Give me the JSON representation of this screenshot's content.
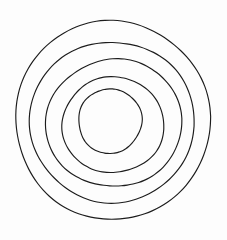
{
  "figure": {
    "kind": "line-drawing",
    "style": "hand-drawn",
    "canvas": {
      "width": 227,
      "height": 240,
      "background_color": "#fdfdfd"
    },
    "stroke": {
      "color": "#1c1c1c",
      "width": 1.15
    },
    "center": {
      "x": 112,
      "y": 120
    },
    "ring_count": 5,
    "rings": [
      {
        "name": "ring-outermost",
        "index": 1,
        "rx": 97,
        "ry": 100,
        "cx": 112.5,
        "cy": 120,
        "rotation": -2,
        "left": 15,
        "right": 210,
        "top": 20,
        "bottom": 220
      },
      {
        "name": "ring-second",
        "index": 2,
        "rx": 82,
        "ry": 81,
        "cx": 112,
        "cy": 122,
        "rotation": 3,
        "left": 30,
        "right": 194,
        "top": 42,
        "bottom": 203
      },
      {
        "name": "ring-third",
        "index": 3,
        "rx": 68,
        "ry": 64,
        "cx": 114,
        "cy": 123,
        "rotation": -4,
        "left": 47,
        "right": 183,
        "top": 60,
        "bottom": 187
      },
      {
        "name": "ring-fourth",
        "index": 4,
        "rx": 51,
        "ry": 48,
        "cx": 113,
        "cy": 125,
        "rotation": 5,
        "left": 62,
        "right": 165,
        "top": 78,
        "bottom": 173
      },
      {
        "name": "ring-innermost",
        "index": 5,
        "rx": 32,
        "ry": 32,
        "cx": 110,
        "cy": 121,
        "rotation": -3,
        "left": 78,
        "right": 142,
        "top": 88,
        "bottom": 153
      }
    ]
  }
}
